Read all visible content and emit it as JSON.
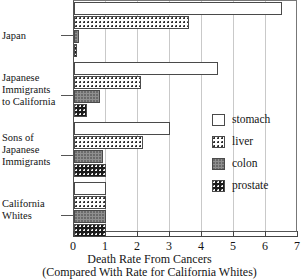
{
  "chart_data": {
    "type": "bar",
    "orientation": "horizontal",
    "title": "",
    "xlabel": "Death Rate From Cancers",
    "xlabel_line2": "(Compared With Rate for California Whites)",
    "ylabel": "",
    "xlim": [
      0,
      7
    ],
    "xticks": [
      0,
      1,
      2,
      3,
      4,
      5,
      6,
      7
    ],
    "xticklabels": [
      "0",
      "1",
      "2",
      "3",
      "4",
      "5",
      "6",
      "7"
    ],
    "grid": "vertical",
    "legend_position": "center-right",
    "categories": [
      "Japan",
      "Japanese Immigrants to California",
      "Sons of Japanese Immigrants",
      "California Whites"
    ],
    "category_labels": [
      [
        "Japan"
      ],
      [
        "Japanese",
        "Immigrants",
        "to California"
      ],
      [
        "Sons of",
        "Japanese",
        "Immigrants"
      ],
      [
        "California",
        "Whites"
      ]
    ],
    "series": [
      {
        "name": "stomach",
        "values": [
          6.5,
          4.5,
          3.0,
          1.0
        ]
      },
      {
        "name": "liver",
        "values": [
          3.6,
          2.1,
          2.15,
          1.0
        ]
      },
      {
        "name": "colon",
        "values": [
          0.15,
          0.8,
          0.9,
          1.0
        ]
      },
      {
        "name": "prostate",
        "values": [
          0.1,
          0.4,
          1.0,
          1.0
        ]
      }
    ],
    "legend": [
      {
        "label": "stomach",
        "fill": "white",
        "color": "#ffffff"
      },
      {
        "label": "liver",
        "fill": "dotted",
        "color": "#ffffff"
      },
      {
        "label": "colon",
        "fill": "gray",
        "color": "#8f8f8f"
      },
      {
        "label": "prostate",
        "fill": "dark-dots",
        "color": "#1b1b1b"
      }
    ]
  }
}
